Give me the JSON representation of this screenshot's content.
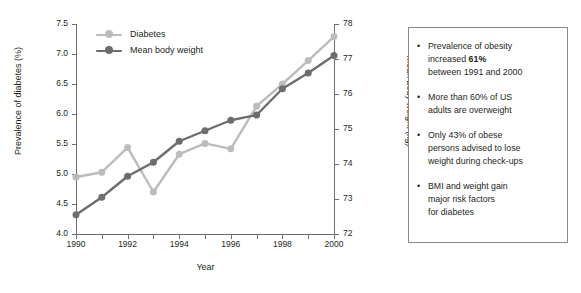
{
  "chart_data": {
    "type": "line",
    "title": "",
    "xlabel": "Year",
    "ylabel": "Prevalence of diabetes (%)",
    "y2label": "Mean body weight (kg)",
    "grid": false,
    "legend_position": "top-left",
    "x": [
      1990,
      1991,
      1992,
      1993,
      1994,
      1995,
      1996,
      1997,
      1998,
      1999,
      2000
    ],
    "xlim": [
      1990,
      2000
    ],
    "xticks": [
      1990,
      1992,
      1994,
      1996,
      1998,
      2000
    ],
    "xtick_labels": [
      "1990",
      "1992",
      "1994",
      "1996",
      "1998",
      "2000"
    ],
    "xminor_ticks": [
      1991,
      1993,
      1995,
      1997,
      1999
    ],
    "ylim": [
      4.0,
      7.5
    ],
    "yticks": [
      4.0,
      4.5,
      5.0,
      5.5,
      6.0,
      6.5,
      7.0,
      7.5
    ],
    "ytick_labels": [
      "4.0",
      "4.5",
      "5.0",
      "5.5",
      "6.0",
      "6.5",
      "7.0",
      "7.5"
    ],
    "y2lim": [
      72,
      78
    ],
    "y2ticks": [
      72,
      73,
      74,
      75,
      76,
      77,
      78
    ],
    "y2tick_labels": [
      "72",
      "73",
      "74",
      "75",
      "76",
      "77",
      "78"
    ],
    "series": [
      {
        "name": "Diabetes",
        "axis": "left",
        "color": "#bcbcbc",
        "marker": "circle",
        "values": [
          4.95,
          5.03,
          5.44,
          4.7,
          5.33,
          5.51,
          5.42,
          6.13,
          6.5,
          6.89,
          7.29
        ]
      },
      {
        "name": "Mean body weight",
        "axis": "right",
        "color": "#6d6d6d",
        "marker": "circle",
        "values": [
          72.55,
          73.05,
          73.65,
          74.05,
          74.65,
          74.95,
          75.25,
          75.4,
          76.15,
          76.6,
          77.1
        ]
      }
    ]
  },
  "legend": {
    "items": [
      {
        "label": "Diabetes",
        "color": "#bcbcbc"
      },
      {
        "label": "Mean body weight",
        "color": "#6d6d6d"
      }
    ]
  },
  "facts_panel": {
    "bullet_glyph": "•",
    "items": [
      {
        "lines": [
          {
            "text": "Prevalence of obesity"
          },
          {
            "text": "increased ",
            "bold": "61%"
          },
          {
            "text": "between 1991 and 2000"
          }
        ]
      },
      {
        "lines": [
          {
            "text": "More than 60% of US"
          },
          {
            "text": "adults are overweight"
          }
        ]
      },
      {
        "lines": [
          {
            "text": "Only 43% of obese"
          },
          {
            "text": "persons advised to lose"
          },
          {
            "text": "weight during check-ups"
          }
        ]
      },
      {
        "lines": [
          {
            "text": "BMI and weight gain"
          },
          {
            "text": "major risk factors"
          },
          {
            "text": "for diabetes"
          }
        ]
      }
    ]
  },
  "colors": {
    "axis": "#6d6e71",
    "text": "#231f20",
    "panel_border": "#8a8a8d",
    "series_light": "#bcbcbc",
    "series_dark": "#6d6d6d",
    "background": "#ffffff"
  }
}
